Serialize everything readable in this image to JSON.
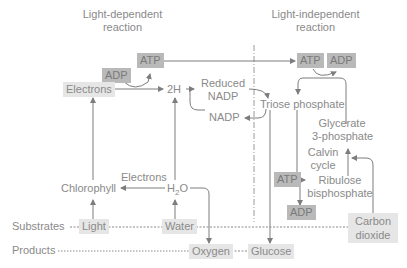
{
  "headers": {
    "light_dependent": [
      "Light-dependent",
      "reaction"
    ],
    "light_independent": [
      "Light-independent",
      "reaction"
    ]
  },
  "row_labels": {
    "substrates": "Substrates",
    "products": "Products"
  },
  "nodes": {
    "adp_left": "ADP",
    "atp_left": "ATP",
    "electrons_box": "Electrons",
    "two_h": "2H",
    "reduced_nadp": [
      "Reduced",
      "NADP"
    ],
    "nadp": "NADP",
    "atp_right": "ATP",
    "adp_right": "ADP",
    "triose_phosphate": "Triose phosphate",
    "glycerate": [
      "Glycerate",
      "3-phosphate"
    ],
    "calvin_cycle": [
      "Calvin",
      "cycle"
    ],
    "ribulose": [
      "Ribulose",
      "bisphosphate"
    ],
    "atp_bottom": "ATP",
    "adp_bottom": "ADP",
    "electrons_label": "Electrons",
    "chlorophyll": "Chlorophyll",
    "water_molecule": {
      "h": "H",
      "sub": "2",
      "o": "O"
    },
    "light": "Light",
    "water": "Water",
    "carbon_dioxide": [
      "Carbon",
      "dioxide"
    ],
    "oxygen": "Oxygen",
    "glucose": "Glucose"
  },
  "colors": {
    "light_box": "#e6e6e6",
    "dark_box": "#b9b9b9",
    "line": "#7d7d7d",
    "text": "#8a8a8a"
  }
}
